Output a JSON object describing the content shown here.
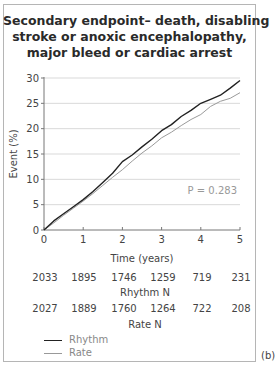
{
  "figure": {
    "title_lines": [
      "Secondary endpoint– death, disabling",
      "stroke or anoxic encephalopathy,",
      "major bleed or cardiac arrest"
    ],
    "panel_label": "(b)",
    "p_value_label": "P = 0.283",
    "number_at_risk": {
      "rhythm": {
        "label": "Rhythm N",
        "values": [
          "2033",
          "1895",
          "1746",
          "1259",
          "719",
          "231"
        ]
      },
      "rate": {
        "label": "Rate N",
        "values": [
          "2027",
          "1889",
          "1760",
          "1264",
          "722",
          "208"
        ]
      }
    },
    "legend": [
      {
        "label": "Rhythm",
        "color": "#222222"
      },
      {
        "label": "Rate",
        "color": "#9a9a9a"
      }
    ]
  },
  "chart_data": {
    "type": "line",
    "title": "Secondary endpoint– death, disabling stroke or anoxic encephalopathy, major bleed or cardiac arrest",
    "xlabel": "Time (years)",
    "ylabel": "Event (%)",
    "xlim": [
      0,
      5
    ],
    "ylim": [
      0,
      30
    ],
    "xticks": [
      0,
      1,
      2,
      3,
      4,
      5
    ],
    "yticks": [
      0,
      5,
      10,
      15,
      20,
      25,
      30
    ],
    "grid": "horizontal",
    "legend_position": "bottom-left",
    "annotations": [
      "P = 0.283"
    ],
    "x": [
      0,
      0.25,
      0.5,
      0.75,
      1,
      1.25,
      1.5,
      1.75,
      2,
      2.25,
      2.5,
      2.75,
      3,
      3.25,
      3.5,
      3.75,
      4,
      4.25,
      4.5,
      4.75,
      5
    ],
    "series": [
      {
        "name": "Rhythm",
        "color": "#222222",
        "values": [
          0,
          1.8,
          3.2,
          4.6,
          6.0,
          7.6,
          9.4,
          11.2,
          13.5,
          14.8,
          16.4,
          17.9,
          19.6,
          20.8,
          22.4,
          23.6,
          25.0,
          25.8,
          26.6,
          28.0,
          29.5
        ]
      },
      {
        "name": "Rate",
        "color": "#9a9a9a",
        "values": [
          0,
          1.4,
          2.9,
          4.3,
          5.7,
          7.2,
          8.8,
          10.4,
          11.9,
          13.6,
          15.2,
          16.6,
          18.2,
          19.3,
          20.6,
          21.8,
          22.8,
          24.4,
          25.4,
          26.0,
          27.1
        ]
      }
    ],
    "number_at_risk": {
      "Rhythm N": [
        2033,
        1895,
        1746,
        1259,
        719,
        231
      ],
      "Rate N": [
        2027,
        1889,
        1760,
        1264,
        722,
        208
      ]
    }
  }
}
